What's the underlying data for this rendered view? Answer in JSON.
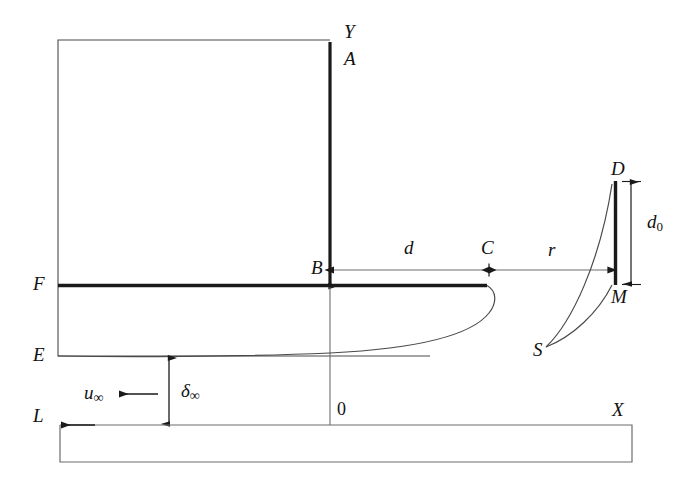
{
  "figure": {
    "type": "technical-line-diagram",
    "background_color": "#ffffff",
    "line_color": "#1a1a1a",
    "width": 696,
    "height": 487
  },
  "axes": {
    "y_axis_label": "Y",
    "x_axis_label": "X",
    "origin_label": "0"
  },
  "points": {
    "a": "A",
    "b": "B",
    "c": "C",
    "d": "D",
    "e": "E",
    "f": "F",
    "l": "L",
    "m": "M",
    "s": "S"
  },
  "dimensions": {
    "d": "d",
    "r": "r",
    "d_zero_base": "d",
    "d_zero_sub": "0",
    "delta_base": "δ",
    "delta_sub": "∞",
    "u_base": "u",
    "u_sub": "∞"
  },
  "annotations": {
    "flow_direction": "leftward free-stream arrow",
    "profile_curve": "velocity profile from S to D and S to M",
    "boundary_layer_curve": "boundary layer edge curve from E region to C"
  }
}
